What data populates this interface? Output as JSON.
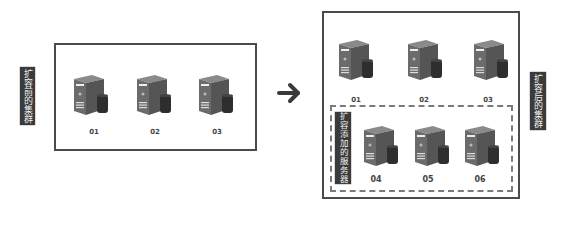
{
  "diagram": {
    "before_cluster": {
      "label": "扩容前的集群",
      "servers": [
        {
          "id": "01"
        },
        {
          "id": "02"
        },
        {
          "id": "03"
        }
      ]
    },
    "arrow": {
      "icon": "arrow-right-icon"
    },
    "after_cluster": {
      "label": "扩容后的集群",
      "original_servers": [
        {
          "id": "01"
        },
        {
          "id": "02"
        },
        {
          "id": "03"
        }
      ],
      "added_group": {
        "label": "扩容添加的服务器",
        "servers": [
          {
            "id": "04"
          },
          {
            "id": "05"
          },
          {
            "id": "06"
          }
        ]
      }
    },
    "colors": {
      "border": "#4a4a4a",
      "label_bg": "#3b3b3b",
      "label_text": "#f0f0f0",
      "server_body": "#6b6b6b",
      "server_side": "#4e4e4e",
      "disk": "#2e2e2e",
      "arrow": "#3a3a3a"
    }
  }
}
